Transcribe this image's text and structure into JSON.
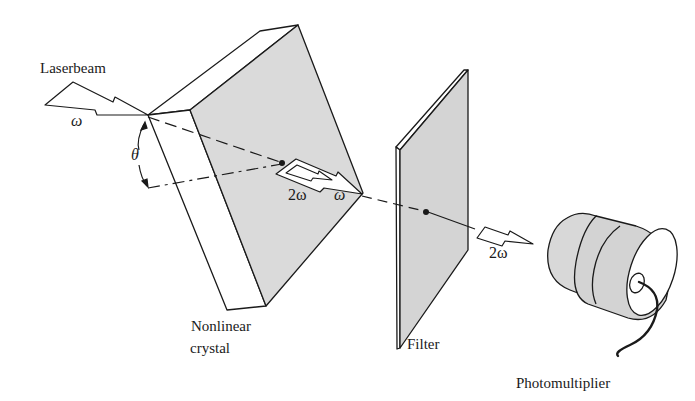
{
  "diagram": {
    "labels": {
      "laserbeam": "Laserbeam",
      "omega_in": "ω",
      "theta": "θ",
      "two_omega_crystal": "2ω",
      "omega_crystal": "ω",
      "two_omega_out": "2ω",
      "crystal_line1": "Nonlinear",
      "crystal_line2": "crystal",
      "filter": "Filter",
      "photomultiplier": "Photomultiplier"
    },
    "components": [
      "Laserbeam",
      "Nonlinear crystal",
      "Filter",
      "Photomultiplier"
    ],
    "colors": {
      "line": "#1a1a1a",
      "shade": "#d9d9d9",
      "shade_dark": "#cfcfcf",
      "background": "#ffffff"
    }
  }
}
